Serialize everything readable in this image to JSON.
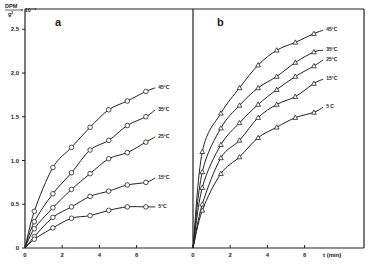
{
  "figure": {
    "ylabel_top": "DPM",
    "ylabel_bottom": "g²",
    "ylabel_scale": "× 10⁻⁴",
    "xlabel": "t (min)"
  },
  "chart_data": [
    {
      "type": "line",
      "panel": "a",
      "title": "a",
      "xlabel": "t (min)",
      "ylabel": "DPM / g² × 10⁻⁴",
      "xlim": [
        0,
        7.5
      ],
      "ylim": [
        0,
        2.6
      ],
      "xticks": [
        0,
        2,
        4,
        6
      ],
      "yticks": [
        0,
        0.5,
        1.0,
        1.5,
        2.0,
        2.5
      ],
      "ytick_labels": [
        "0",
        "0.5",
        "1.0",
        "1.5",
        "2.0",
        "2.5"
      ],
      "grid": false,
      "marker": "circle",
      "series": [
        {
          "name": "45°C",
          "label": "45°C",
          "curve_end": 1.83,
          "x": [
            0.5,
            1.5,
            2.5,
            3.5,
            4.5,
            5.5,
            6.5
          ],
          "values": [
            0.42,
            0.92,
            1.15,
            1.38,
            1.58,
            1.68,
            1.79
          ]
        },
        {
          "name": "35°C",
          "label": "35°C",
          "curve_end": 1.58,
          "x": [
            0.5,
            1.5,
            2.5,
            3.5,
            4.5,
            5.5,
            6.5
          ],
          "values": [
            0.3,
            0.62,
            0.86,
            1.12,
            1.23,
            1.4,
            1.5
          ]
        },
        {
          "name": "25°C",
          "label": "25°C",
          "curve_end": 1.27,
          "x": [
            0.5,
            1.5,
            2.5,
            3.5,
            4.5,
            5.5,
            6.5
          ],
          "values": [
            0.22,
            0.46,
            0.67,
            0.85,
            1.02,
            1.09,
            1.21
          ]
        },
        {
          "name": "15°C",
          "label": "15°C",
          "curve_end": 0.8,
          "x": [
            0.5,
            1.5,
            2.5,
            3.5,
            4.5,
            5.5,
            6.5
          ],
          "values": [
            0.13,
            0.35,
            0.47,
            0.59,
            0.65,
            0.72,
            0.75
          ]
        },
        {
          "name": "5°C",
          "label": "5°C",
          "curve_end": 0.47,
          "x": [
            0.5,
            1.5,
            2.5,
            3.5,
            4.5,
            5.5,
            6.5
          ],
          "values": [
            0.1,
            0.23,
            0.34,
            0.37,
            0.43,
            0.47,
            0.47
          ]
        }
      ]
    },
    {
      "type": "line",
      "panel": "b",
      "title": "b",
      "xlabel": "t (min)",
      "ylabel": "DPM / g² × 10⁻⁴",
      "xlim": [
        0,
        7.5
      ],
      "ylim": [
        0,
        2.6
      ],
      "xticks": [
        0,
        2,
        4,
        6
      ],
      "grid": false,
      "marker": "triangle",
      "series": [
        {
          "name": "45°C",
          "label": "45°C",
          "curve_end": 2.49,
          "x": [
            0.5,
            1.5,
            2.5,
            3.5,
            4.5,
            5.5,
            6.5
          ],
          "values": [
            1.1,
            1.54,
            1.83,
            2.09,
            2.26,
            2.35,
            2.45
          ]
        },
        {
          "name": "35°C",
          "label": "35°C",
          "curve_end": 2.26,
          "x": [
            0.5,
            1.5,
            2.5,
            3.5,
            4.5,
            5.5,
            6.5
          ],
          "values": [
            0.87,
            1.37,
            1.63,
            1.83,
            1.96,
            2.12,
            2.24
          ]
        },
        {
          "name": "25°C",
          "label": "25°C",
          "curve_end": 2.15,
          "x": [
            0.5,
            1.5,
            2.5,
            3.5,
            4.5,
            5.5,
            6.5
          ],
          "values": [
            0.69,
            1.18,
            1.43,
            1.64,
            1.81,
            1.96,
            2.08
          ]
        },
        {
          "name": "15°C",
          "label": "15°C",
          "curve_end": 1.93,
          "x": [
            0.5,
            1.5,
            2.5,
            3.5,
            4.5,
            5.5,
            6.5
          ],
          "values": [
            0.5,
            1.03,
            1.23,
            1.49,
            1.64,
            1.73,
            1.88
          ]
        },
        {
          "name": "5°C",
          "label": "5 C",
          "curve_end": 1.61,
          "x": [
            0.5,
            1.5,
            2.5,
            3.5,
            4.5,
            5.5,
            6.5
          ],
          "values": [
            0.43,
            0.85,
            1.04,
            1.26,
            1.38,
            1.49,
            1.55
          ]
        }
      ]
    }
  ]
}
